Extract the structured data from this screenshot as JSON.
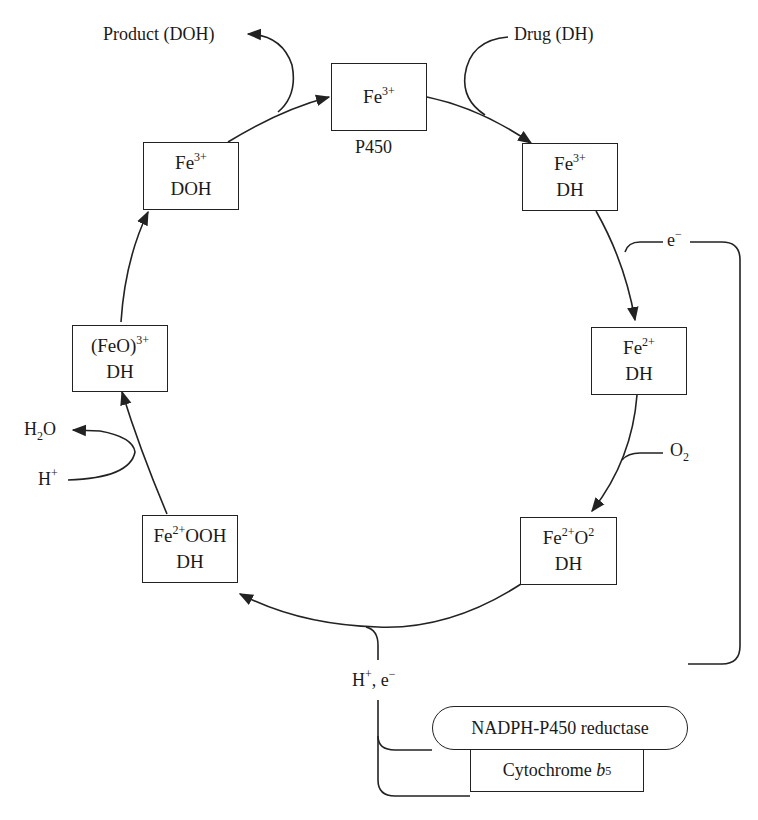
{
  "diagram": {
    "line_color": "#222222",
    "background": "#ffffff"
  },
  "nodes": {
    "p450": {
      "base": "Fe",
      "sup": "3+",
      "caption": "P450"
    },
    "fe3_dh": {
      "base": "Fe",
      "sup": "3+",
      "line2": "DH"
    },
    "fe2_dh": {
      "base": "Fe",
      "sup": "2+",
      "line2": "DH"
    },
    "fe2o2_dh": {
      "base": "Fe",
      "sup": "2+",
      "mid": "O",
      "sup2": "2",
      "line2": "DH"
    },
    "fe2ooh_dh": {
      "base": "Fe",
      "sup": "2+",
      "mid": "OOH",
      "line2": "DH"
    },
    "feo3_dh": {
      "base": "(FeO)",
      "sup": "3+",
      "line2": "DH"
    },
    "fe3_doh": {
      "base": "Fe",
      "sup": "3+",
      "line2": "DOH"
    }
  },
  "labels": {
    "product": "Product (DOH)",
    "drug": "Drug (DH)",
    "electron": {
      "base": "e",
      "sup": "−"
    },
    "oxygen": {
      "base": "O",
      "sub": "2"
    },
    "water": {
      "base": "H",
      "sub": "2",
      "tail": "O"
    },
    "proton": {
      "base": "H",
      "sup": "+"
    },
    "proton_electron": {
      "base": "H",
      "sup": "+",
      "tail": ", e",
      "sup2": "−"
    }
  },
  "enzymes": {
    "reductase": "NADPH-P450 reductase",
    "cytochrome": {
      "base": "Cytochrome ",
      "italic": "b",
      "sub": "5"
    }
  }
}
